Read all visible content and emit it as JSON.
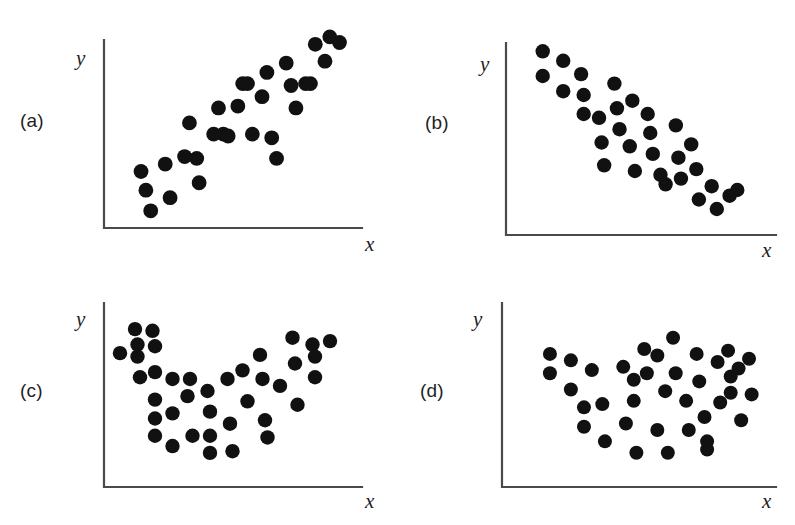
{
  "figure": {
    "type": "scatter-plot-grid",
    "background_color": "#ffffff",
    "point_color": "#111111",
    "axis_color": "#4a4a4a",
    "panel_count": 4
  },
  "panels": [
    {
      "letter": "(a)",
      "xlabel": "x",
      "ylabel": "y",
      "pattern": "strong positive linear association"
    },
    {
      "letter": "(b)",
      "xlabel": "x",
      "ylabel": "y",
      "pattern": "strong negative linear association"
    },
    {
      "letter": "(c)",
      "xlabel": "x",
      "ylabel": "y",
      "pattern": "curved U-shaped (quadratic) association"
    },
    {
      "letter": "(d)",
      "xlabel": "x",
      "ylabel": "y",
      "pattern": "fan / V-shaped scatter, no linear association"
    }
  ],
  "chart_data": [
    {
      "type": "scatter",
      "title": "(a)",
      "xlabel": "x",
      "ylabel": "y",
      "grid": false,
      "legend": false,
      "xlim": [
        0,
        100
      ],
      "ylim": [
        0,
        100
      ],
      "points": [
        [
          12,
          27
        ],
        [
          14,
          17
        ],
        [
          16,
          6
        ],
        [
          22,
          31
        ],
        [
          24,
          13
        ],
        [
          30,
          35
        ],
        [
          32,
          53
        ],
        [
          35,
          34
        ],
        [
          36,
          21
        ],
        [
          42,
          47
        ],
        [
          44,
          61
        ],
        [
          46,
          47
        ],
        [
          48,
          46
        ],
        [
          52,
          62
        ],
        [
          54,
          74
        ],
        [
          56,
          74
        ],
        [
          58,
          47
        ],
        [
          62,
          67
        ],
        [
          64,
          80
        ],
        [
          66,
          45
        ],
        [
          68,
          34
        ],
        [
          72,
          85
        ],
        [
          74,
          73
        ],
        [
          76,
          61
        ],
        [
          80,
          74
        ],
        [
          82,
          74
        ],
        [
          84,
          95
        ],
        [
          88,
          86
        ],
        [
          90,
          99
        ],
        [
          94,
          96
        ]
      ]
    },
    {
      "type": "scatter",
      "title": "(b)",
      "xlabel": "x",
      "ylabel": "y",
      "grid": false,
      "legend": false,
      "xlim": [
        0,
        100
      ],
      "ylim": [
        0,
        100
      ],
      "points": [
        [
          12,
          93
        ],
        [
          12,
          80
        ],
        [
          20,
          88
        ],
        [
          20,
          72
        ],
        [
          27,
          81
        ],
        [
          28,
          70
        ],
        [
          28,
          60
        ],
        [
          34,
          58
        ],
        [
          35,
          45
        ],
        [
          36,
          33
        ],
        [
          40,
          76
        ],
        [
          41,
          63
        ],
        [
          42,
          52
        ],
        [
          46,
          43
        ],
        [
          47,
          67
        ],
        [
          48,
          30
        ],
        [
          53,
          60
        ],
        [
          54,
          50
        ],
        [
          55,
          39
        ],
        [
          58,
          28
        ],
        [
          60,
          23
        ],
        [
          64,
          54
        ],
        [
          65,
          37
        ],
        [
          66,
          26
        ],
        [
          70,
          44
        ],
        [
          72,
          31
        ],
        [
          73,
          15
        ],
        [
          78,
          22
        ],
        [
          80,
          10
        ],
        [
          85,
          17
        ],
        [
          88,
          20
        ]
      ]
    },
    {
      "type": "scatter",
      "title": "(c)",
      "xlabel": "x",
      "ylabel": "y",
      "grid": false,
      "legend": false,
      "xlim": [
        0,
        100
      ],
      "ylim": [
        0,
        100
      ],
      "points": [
        [
          4,
          72
        ],
        [
          10,
          86
        ],
        [
          11,
          70
        ],
        [
          11,
          77
        ],
        [
          12,
          58
        ],
        [
          17,
          85
        ],
        [
          18,
          76
        ],
        [
          18,
          61
        ],
        [
          18,
          45
        ],
        [
          18,
          34
        ],
        [
          18,
          24
        ],
        [
          25,
          57
        ],
        [
          25,
          37
        ],
        [
          25,
          18
        ],
        [
          31,
          47
        ],
        [
          32,
          57
        ],
        [
          33,
          24
        ],
        [
          39,
          50
        ],
        [
          40,
          38
        ],
        [
          40,
          24
        ],
        [
          40,
          14
        ],
        [
          47,
          57
        ],
        [
          48,
          31
        ],
        [
          49,
          15
        ],
        [
          53,
          62
        ],
        [
          55,
          44
        ],
        [
          60,
          71
        ],
        [
          61,
          57
        ],
        [
          62,
          33
        ],
        [
          63,
          23
        ],
        [
          68,
          53
        ],
        [
          73,
          81
        ],
        [
          74,
          66
        ],
        [
          75,
          42
        ],
        [
          81,
          77
        ],
        [
          82,
          70
        ],
        [
          82,
          58
        ],
        [
          88,
          79
        ]
      ]
    },
    {
      "type": "scatter",
      "title": "(d)",
      "xlabel": "x",
      "ylabel": "y",
      "grid": false,
      "legend": false,
      "xlim": [
        0,
        100
      ],
      "ylim": [
        0,
        100
      ],
      "points": [
        [
          16,
          76
        ],
        [
          16,
          64
        ],
        [
          24,
          72
        ],
        [
          24,
          54
        ],
        [
          29,
          43
        ],
        [
          29,
          31
        ],
        [
          32,
          66
        ],
        [
          36,
          45
        ],
        [
          37,
          22
        ],
        [
          44,
          68
        ],
        [
          45,
          33
        ],
        [
          48,
          60
        ],
        [
          48,
          47
        ],
        [
          49,
          15
        ],
        [
          52,
          79
        ],
        [
          53,
          64
        ],
        [
          57,
          75
        ],
        [
          57,
          29
        ],
        [
          60,
          53
        ],
        [
          61,
          15
        ],
        [
          63,
          86
        ],
        [
          64,
          64
        ],
        [
          68,
          47
        ],
        [
          69,
          29
        ],
        [
          72,
          76
        ],
        [
          73,
          59
        ],
        [
          75,
          37
        ],
        [
          76,
          22
        ],
        [
          76,
          17
        ],
        [
          80,
          71
        ],
        [
          81,
          46
        ],
        [
          84,
          78
        ],
        [
          85,
          62
        ],
        [
          85,
          52
        ],
        [
          88,
          67
        ],
        [
          89,
          35
        ],
        [
          92,
          73
        ],
        [
          93,
          51
        ]
      ]
    }
  ]
}
